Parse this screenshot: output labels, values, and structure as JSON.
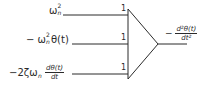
{
  "diagram": {
    "ink_color": "#2b2b2b",
    "background": "#ffffff",
    "inputs": [
      {
        "label": "ωn²",
        "symbol": "ω",
        "subscript": "n",
        "superscript": "2",
        "gain": "1"
      },
      {
        "label": "−ωn²θ(t)",
        "prefix": "−",
        "symbol": "ω",
        "subscript": "n",
        "superscript": "2",
        "suffix": "θ(t)",
        "gain": "1"
      },
      {
        "label": "−2ζωn dθ(t)/dt",
        "prefix": "−2ζω",
        "subscript": "n",
        "frac_num": "dθ(t)",
        "frac_den": "dt",
        "gain": "1"
      }
    ],
    "output": {
      "label": "−d²θ(t)/dt²",
      "prefix": "−",
      "frac_num": "d²θ(t)",
      "frac_den": "dt²"
    },
    "block": {
      "type": "summing-amplifier",
      "shape": "triangle"
    }
  }
}
